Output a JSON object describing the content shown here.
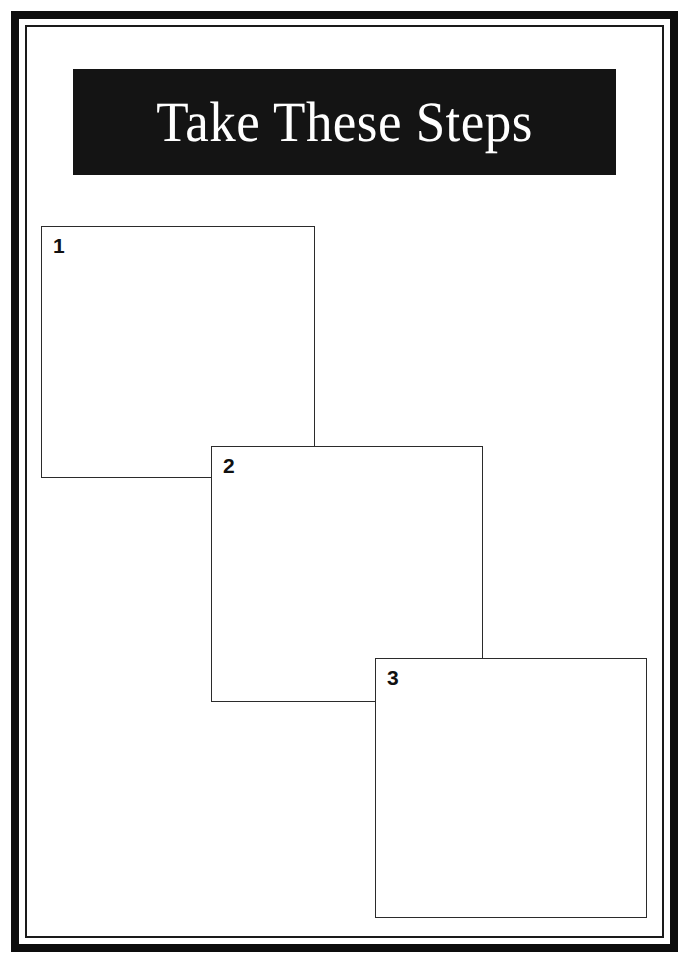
{
  "document": {
    "title": "Take These Steps",
    "background_color": "#ffffff"
  },
  "frame": {
    "outer_color": "#0d0d0d",
    "inner_color": "#1a1a1a"
  },
  "banner": {
    "title": "Take These Steps",
    "background_color": "#141414",
    "text_color": "#ffffff"
  },
  "steps": [
    {
      "number": "1",
      "content": "",
      "border_color": "#2b2b2b",
      "fill_color": "#ffffff"
    },
    {
      "number": "2",
      "content": "",
      "border_color": "#2b2b2b",
      "fill_color": "#ffffff"
    },
    {
      "number": "3",
      "content": "",
      "border_color": "#2b2b2b",
      "fill_color": "#ffffff"
    }
  ]
}
